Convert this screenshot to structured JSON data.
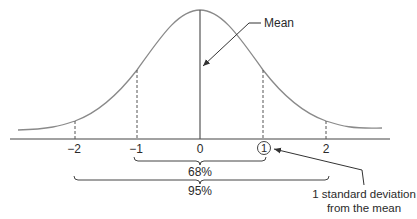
{
  "diagram": {
    "type": "normal-distribution",
    "annotations": {
      "mean_label": "Mean",
      "sd_label_line1": "1 standard deviation",
      "sd_label_line2": "from the mean"
    },
    "axis_ticks": [
      "−2",
      "−1",
      "0",
      "1",
      "2"
    ],
    "ranges": [
      {
        "label": "68%",
        "from": -1,
        "to": 1
      },
      {
        "label": "95%",
        "from": -2,
        "to": 2
      }
    ],
    "colors": {
      "curve": "#8a8a8a",
      "line": "#444444",
      "text": "#2a2a2a"
    }
  }
}
